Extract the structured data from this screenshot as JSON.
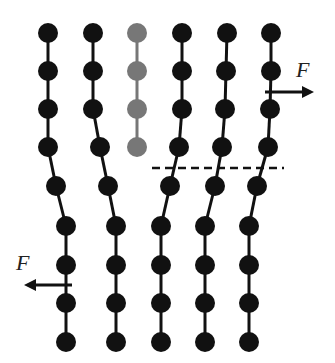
{
  "diagram": {
    "colors": {
      "atom": "#111111",
      "highlight_atom": "#777777",
      "bond": "#111111",
      "slip_plane": "#111111",
      "arrow": "#111111"
    },
    "labels": {
      "force_top": "F",
      "force_bottom": "F"
    },
    "upper_columns": [
      {
        "atoms": [
          [
            48,
            33
          ],
          [
            48,
            71
          ],
          [
            48,
            109
          ],
          [
            48,
            147
          ]
        ],
        "highlight": false
      },
      {
        "atoms": [
          [
            93,
            33
          ],
          [
            93,
            71
          ],
          [
            93,
            109
          ],
          [
            100,
            147
          ]
        ],
        "highlight": false
      },
      {
        "atoms": [
          [
            137,
            33
          ],
          [
            137,
            71
          ],
          [
            137,
            109
          ],
          [
            137,
            147
          ]
        ],
        "highlight": true
      },
      {
        "atoms": [
          [
            182,
            33
          ],
          [
            182,
            71
          ],
          [
            182,
            109
          ],
          [
            179,
            147
          ]
        ],
        "highlight": false
      },
      {
        "atoms": [
          [
            227,
            33
          ],
          [
            226,
            71
          ],
          [
            225,
            109
          ],
          [
            222,
            147
          ]
        ],
        "highlight": false
      },
      {
        "atoms": [
          [
            271,
            33
          ],
          [
            271,
            71
          ],
          [
            270,
            109
          ],
          [
            268,
            147
          ]
        ],
        "highlight": false
      }
    ],
    "lower_columns": [
      {
        "atoms": [
          [
            56,
            186
          ],
          [
            66,
            226
          ],
          [
            66,
            265
          ],
          [
            66,
            303
          ],
          [
            66,
            342
          ]
        ],
        "connect_from": [
          48,
          147
        ]
      },
      {
        "atoms": [
          [
            108,
            186
          ],
          [
            116,
            226
          ],
          [
            116,
            265
          ],
          [
            116,
            303
          ],
          [
            116,
            342
          ]
        ],
        "connect_from": [
          100,
          147
        ]
      },
      {
        "atoms": [
          [
            170,
            186
          ],
          [
            161,
            226
          ],
          [
            161,
            265
          ],
          [
            161,
            303
          ],
          [
            161,
            342
          ]
        ],
        "connect_from": [
          179,
          147
        ]
      },
      {
        "atoms": [
          [
            215,
            186
          ],
          [
            205,
            226
          ],
          [
            205,
            265
          ],
          [
            205,
            303
          ],
          [
            205,
            342
          ]
        ],
        "connect_from": [
          222,
          147
        ]
      },
      {
        "atoms": [
          [
            257,
            186
          ],
          [
            249,
            226
          ],
          [
            249,
            265
          ],
          [
            249,
            303
          ],
          [
            249,
            342
          ]
        ],
        "connect_from": [
          268,
          147
        ]
      }
    ],
    "slip_plane": {
      "x1": 152,
      "x2": 284,
      "y": 168
    },
    "force_top_arrow": {
      "x1": 265,
      "x2": 314,
      "y": 92,
      "label_x": 296,
      "label_y": 77
    },
    "force_bottom_arrow": {
      "x1": 72,
      "x2": 24,
      "y": 285,
      "label_x": 16,
      "label_y": 270
    }
  }
}
